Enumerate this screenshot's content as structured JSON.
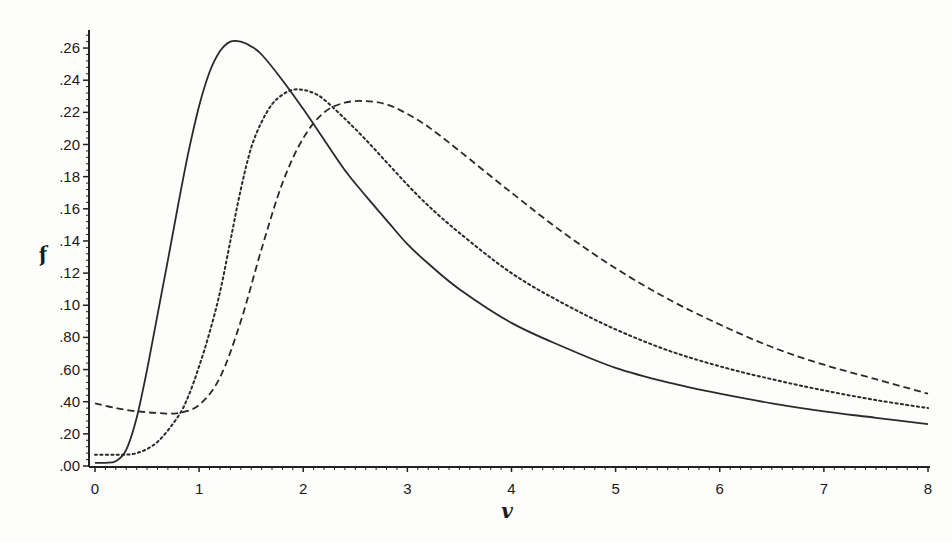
{
  "chart_data": {
    "type": "line",
    "title": "",
    "xlabel": "v",
    "ylabel": "f",
    "xlim": [
      0,
      8
    ],
    "ylim": [
      0,
      0.27
    ],
    "grid": false,
    "legend": null,
    "x_ticks": [
      "0",
      "1",
      "2",
      "3",
      "4",
      "5",
      "6",
      "7",
      "8"
    ],
    "y_ticks": [
      ".00",
      ".20",
      ".40",
      ".60",
      ".80",
      ".10",
      ".12",
      ".14",
      ".16",
      ".18",
      ".20",
      ".22",
      ".24",
      ".26"
    ],
    "series": [
      {
        "name": "solid",
        "style": "solid",
        "x": [
          0,
          0.1,
          0.2,
          0.3,
          0.4,
          0.5,
          0.6,
          0.7,
          0.8,
          0.9,
          1.0,
          1.1,
          1.2,
          1.3,
          1.4,
          1.5,
          1.6,
          1.8,
          2.0,
          2.2,
          2.4,
          2.6,
          2.8,
          3.0,
          3.2,
          3.5,
          4.0,
          4.5,
          5.0,
          5.5,
          6.0,
          6.5,
          7.0,
          7.5,
          8.0
        ],
        "values": [
          0.002,
          0.002,
          0.003,
          0.01,
          0.03,
          0.06,
          0.094,
          0.128,
          0.163,
          0.196,
          0.224,
          0.245,
          0.258,
          0.264,
          0.264,
          0.261,
          0.256,
          0.24,
          0.222,
          0.203,
          0.184,
          0.168,
          0.153,
          0.138,
          0.126,
          0.11,
          0.089,
          0.074,
          0.061,
          0.052,
          0.045,
          0.039,
          0.034,
          0.03,
          0.026
        ]
      },
      {
        "name": "dotted",
        "style": "dotted",
        "x": [
          0,
          0.2,
          0.4,
          0.6,
          0.8,
          0.9,
          1.0,
          1.1,
          1.2,
          1.3,
          1.4,
          1.5,
          1.6,
          1.7,
          1.8,
          1.9,
          2.0,
          2.1,
          2.2,
          2.4,
          2.6,
          2.8,
          3.0,
          3.2,
          3.5,
          4.0,
          4.5,
          5.0,
          5.5,
          6.0,
          6.5,
          7.0,
          7.5,
          8.0
        ],
        "values": [
          0.007,
          0.007,
          0.008,
          0.015,
          0.031,
          0.044,
          0.062,
          0.083,
          0.108,
          0.14,
          0.172,
          0.198,
          0.214,
          0.225,
          0.231,
          0.234,
          0.234,
          0.232,
          0.228,
          0.216,
          0.203,
          0.189,
          0.175,
          0.162,
          0.145,
          0.12,
          0.101,
          0.085,
          0.072,
          0.062,
          0.054,
          0.047,
          0.041,
          0.036
        ]
      },
      {
        "name": "dashed",
        "style": "dashed",
        "x": [
          0,
          0.2,
          0.4,
          0.6,
          0.8,
          1.0,
          1.2,
          1.4,
          1.6,
          1.8,
          2.0,
          2.2,
          2.4,
          2.6,
          2.8,
          3.0,
          3.2,
          3.5,
          4.0,
          4.5,
          5.0,
          5.5,
          6.0,
          6.5,
          7.0,
          7.5,
          8.0
        ],
        "values": [
          0.039,
          0.036,
          0.034,
          0.033,
          0.033,
          0.038,
          0.055,
          0.09,
          0.135,
          0.176,
          0.204,
          0.22,
          0.226,
          0.227,
          0.225,
          0.219,
          0.211,
          0.196,
          0.17,
          0.145,
          0.123,
          0.104,
          0.088,
          0.074,
          0.063,
          0.054,
          0.045
        ]
      }
    ]
  },
  "axes": {
    "x_title": "v",
    "y_title": "f"
  }
}
